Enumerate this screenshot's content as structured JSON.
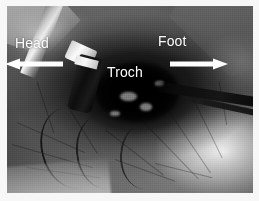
{
  "figure": {
    "kind": "intraoperative-photograph",
    "modality": "grayscale surgical photo",
    "orientation_note": "Head to the left, Foot to the right",
    "border_color": "#f7f7f7",
    "annotation_color": "#ffffff"
  },
  "annotations": {
    "labels": [
      {
        "id": "head",
        "text": "Head",
        "x": 15,
        "y": 36
      },
      {
        "id": "troch",
        "text": "Troch",
        "x": 107,
        "y": 65
      },
      {
        "id": "foot",
        "text": "Foot",
        "x": 158,
        "y": 34
      }
    ],
    "arrows": [
      {
        "id": "head-direction",
        "direction": "left",
        "x": 5,
        "y": 58,
        "length": 58,
        "color": "#ffffff"
      },
      {
        "id": "foot-direction",
        "direction": "right",
        "x": 170,
        "y": 58,
        "length": 58,
        "color": "#ffffff"
      }
    ]
  },
  "scene": {
    "structures": [
      "surgical drapes",
      "incision / wound cavity",
      "greater trochanter",
      "metallic retractor instrument",
      "dark instrument shaft from right",
      "suction tubing"
    ]
  }
}
